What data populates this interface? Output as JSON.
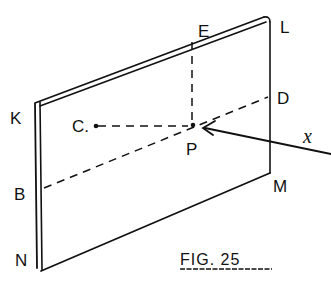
{
  "figure": {
    "caption": "FIG. 25",
    "labels": {
      "K": "K",
      "E": "E",
      "L": "L",
      "D": "D",
      "C": "C.",
      "P": "P",
      "x": "x",
      "B": "B",
      "M": "M",
      "N": "N"
    },
    "colors": {
      "ink": "#111111",
      "background": "#ffffff"
    }
  }
}
